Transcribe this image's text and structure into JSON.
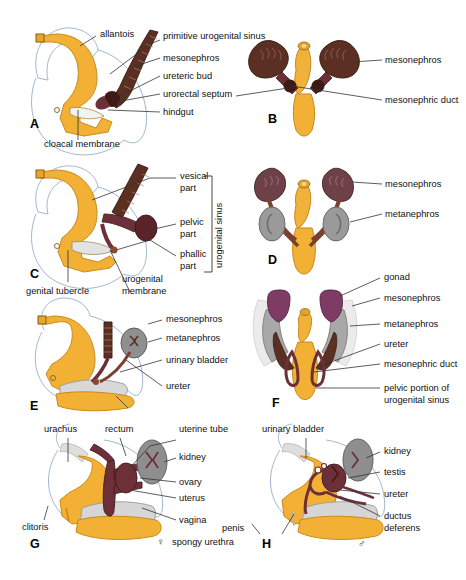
{
  "figure": {
    "panels": [
      {
        "id": "A",
        "letter": "A"
      },
      {
        "id": "B",
        "letter": "B"
      },
      {
        "id": "C",
        "letter": "C"
      },
      {
        "id": "D",
        "letter": "D"
      },
      {
        "id": "E",
        "letter": "E"
      },
      {
        "id": "F",
        "letter": "F"
      },
      {
        "id": "G",
        "letter": "G"
      },
      {
        "id": "H",
        "letter": "H"
      }
    ]
  },
  "labels": {
    "a": {
      "allantois": "allantois",
      "primitive_urogenital_sinus": "primitive urogenital sinus",
      "mesonephros": "mesonephros",
      "ureteric_bud": "ureteric bud",
      "urorectal_septum": "urorectal septum",
      "hindgut": "hindgut",
      "cloacal_membrane": "cloacal membrane"
    },
    "b": {
      "mesonephros": "mesonephros",
      "mesonephric_duct": "mesonephric duct"
    },
    "c": {
      "vesical_part": "vesical",
      "vesical_part2": "part",
      "pelvic_part": "pelvic",
      "pelvic_part2": "part",
      "phallic_part": "phallic",
      "phallic_part2": "part",
      "bracket": "urogenital sinus",
      "genital_tubercle": "genital tubercle",
      "urogenital_membrane": "urogenital",
      "urogenital_membrane2": "membrane"
    },
    "d": {
      "mesonephros": "mesonephros",
      "metanephros": "metanephros"
    },
    "e": {
      "mesonephros": "mesonephros",
      "metanephros": "metanephros",
      "urinary_bladder": "urinary bladder",
      "ureter": "ureter"
    },
    "f": {
      "gonad": "gonad",
      "mesonephros": "mesonephros",
      "metanephros": "metanephros",
      "ureter": "ureter",
      "mesonephric_duct": "mesonephric duct",
      "pelvic_portion": "pelvic portion of",
      "pelvic_portion2": "urogenital sinus"
    },
    "g": {
      "urachus": "urachus",
      "rectum": "rectum",
      "uterine_tube": "uterine tube",
      "kidney": "kidney",
      "ovary": "ovary",
      "uterus": "uterus",
      "vagina": "vagina",
      "clitoris": "clitoris",
      "spongy_urethra": "spongy urethra",
      "female_symbol": "♀"
    },
    "h": {
      "urinary_bladder": "urinary bladder",
      "kidney": "kidney",
      "testis": "testis",
      "ureter": "ureter",
      "ductus": "ductus",
      "deferens": "deferens",
      "penis": "penis",
      "male_symbol": "♂"
    }
  },
  "colors": {
    "gold": "#f2b134",
    "gold_light": "#f7c85a",
    "gold_dark": "#e0991f",
    "maroon": "#6e3038",
    "dark_brown": "#5b2f22",
    "brown": "#7a4432",
    "purple": "#7e3b63",
    "gray": "#9a9a9a",
    "gray_light": "#c8c8c8",
    "outline_blue": "#9fb8d4",
    "white": "#ffffff",
    "text": "#111111"
  }
}
